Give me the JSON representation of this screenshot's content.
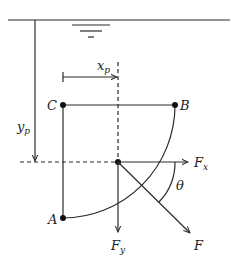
{
  "diagram": {
    "colors": {
      "line": "#2a2a2a",
      "background": "#ffffff",
      "text": "#222222"
    },
    "water_surface": {
      "symbol": "free-surface-triangle-lines"
    },
    "points": {
      "A": {
        "label": "A"
      },
      "B": {
        "label": "B"
      },
      "C": {
        "label": "C"
      }
    },
    "dimensions": {
      "x_p": {
        "label": "x",
        "subscript": "p"
      },
      "y_p": {
        "label": "y",
        "subscript": "p"
      }
    },
    "forces": {
      "Fx": {
        "label": "F",
        "subscript": "x"
      },
      "Fy": {
        "label": "F",
        "subscript": "y"
      },
      "F": {
        "label": "F"
      }
    },
    "angle": {
      "label": "θ"
    }
  }
}
